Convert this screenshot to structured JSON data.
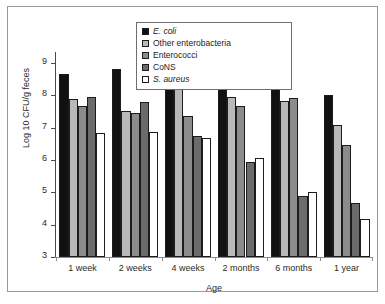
{
  "chart_data": {
    "type": "bar",
    "title": "",
    "xlabel": "Age",
    "ylabel": "Log 10 CFU/g feces",
    "ylim": [
      3,
      9
    ],
    "yticks": [
      3,
      4,
      5,
      6,
      7,
      8,
      9
    ],
    "grid": false,
    "legend_position": "top-center",
    "categories": [
      "1 week",
      "2 weeks",
      "4 weeks",
      "2 months",
      "6 months",
      "1 year"
    ],
    "series": [
      {
        "name": "E. coli",
        "italic": true,
        "color": "#111111",
        "values": [
          8.65,
          8.8,
          8.65,
          8.45,
          8.52,
          8.02
        ]
      },
      {
        "name": "Other enterobacteria",
        "italic": false,
        "color": "#b9b9b9",
        "values": [
          7.88,
          7.52,
          8.42,
          7.95,
          7.82,
          7.08
        ]
      },
      {
        "name": "Enterococci",
        "italic": false,
        "color": "#8c8c8c",
        "values": [
          7.68,
          7.45,
          7.35,
          7.68,
          7.92,
          6.45
        ]
      },
      {
        "name": "CoNS",
        "italic": false,
        "color": "#6b6b6b",
        "values": [
          7.95,
          7.78,
          6.75,
          5.93,
          4.88,
          4.68
        ]
      },
      {
        "name": "S. aureus",
        "italic": true,
        "color": "#ffffff",
        "values": [
          6.85,
          6.88,
          6.68,
          6.05,
          5.0,
          4.18
        ]
      }
    ]
  },
  "legend": {
    "columns": [
      {
        "items": [
          "E. coli",
          "Other enterobacteria",
          "Enterococci"
        ]
      },
      {
        "items": [
          "CoNS",
          "S. aureus"
        ]
      }
    ]
  },
  "axes": {
    "y_title": "Log 10 CFU/g feces",
    "x_title": "Age",
    "y_tick_labels": [
      "9",
      "8",
      "7",
      "6",
      "5",
      "4",
      "3"
    ]
  }
}
